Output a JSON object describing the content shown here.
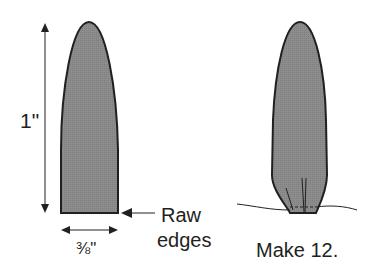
{
  "diagram": {
    "left_piece": {
      "height_label": "1\"",
      "width_label": "⅜\"",
      "callout_label_line1": "Raw",
      "callout_label_line2": "edges"
    },
    "right_piece": {
      "caption": "Make 12."
    },
    "colors": {
      "fill": "#8a8a8a",
      "stroke": "#231f20",
      "arrow": "#231f20",
      "background": "#ffffff"
    }
  }
}
